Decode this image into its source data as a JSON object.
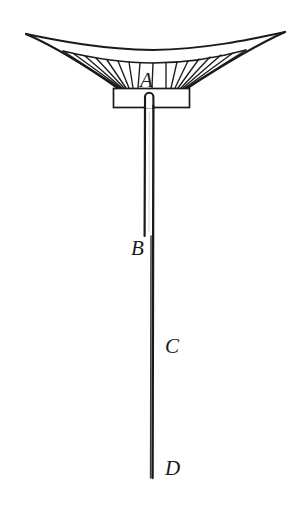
{
  "figure": {
    "type": "line-drawing",
    "background_color": "#ffffff",
    "ink_color": "#1a1a1a",
    "width": 306,
    "height": 507,
    "labels": [
      {
        "id": "A",
        "text": "A",
        "x": 140,
        "y": 70,
        "part": "canopy-mount-box"
      },
      {
        "id": "B",
        "text": "B",
        "x": 131,
        "y": 238,
        "part": "rod-upper-segment-end"
      },
      {
        "id": "C",
        "text": "C",
        "x": 165,
        "y": 336,
        "part": "rod-middle"
      },
      {
        "id": "D",
        "text": "D",
        "x": 165,
        "y": 458,
        "part": "rod-lower-tip"
      }
    ],
    "canopy": {
      "name": "parachute-canopy",
      "left_tip": {
        "x": 26,
        "y": 34
      },
      "right_tip": {
        "x": 285,
        "y": 32
      },
      "rim_sag_y": 50,
      "hub_left": {
        "x": 119,
        "y": 88
      },
      "hub_right": {
        "x": 186,
        "y": 88
      },
      "rib_count": 17,
      "rib_fan_top_left_x": 63,
      "rib_fan_top_right_x": 246
    },
    "mount_box": {
      "name": "canopy-mount-box",
      "x": 113,
      "y": 88,
      "width": 77,
      "height": 20
    },
    "rod": {
      "name": "suspension-rod",
      "center_x": 149,
      "thickness": 8,
      "top_y": 92,
      "bottom_y": 478,
      "upper_segment_end_y": 236,
      "cap": "rounded"
    }
  }
}
